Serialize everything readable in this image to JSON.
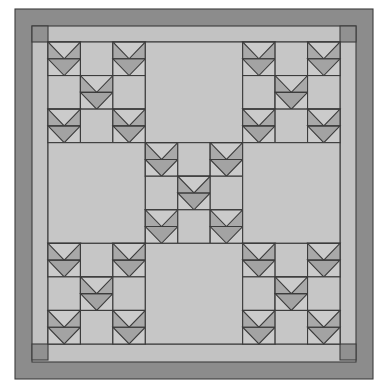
{
  "quilt": {
    "title": "Flying Geese Nine-Patch Quilt",
    "colors": {
      "background": "#ffffff",
      "outer_border": "#8c8c8c",
      "inner_frame": "#c2c2c2",
      "corner_square": "#919191",
      "field": "#c6c6c6",
      "goose_side": "#a9a9a9",
      "goose_center": "#a3a3a3",
      "sky": "#cbcbcb",
      "seam": "#3c3c3c"
    },
    "geometry": {
      "outer": {
        "x": 15,
        "y": 9,
        "w": 358,
        "h": 370
      },
      "inner": {
        "x": 32,
        "y": 26,
        "w": 324,
        "h": 336
      },
      "grid": {
        "x": 48,
        "y": 42,
        "w": 292,
        "h": 302
      }
    },
    "layout": {
      "blocks_per_side": 3,
      "cells_per_block": 3,
      "pieced_blocks": [
        [
          0,
          0
        ],
        [
          0,
          2
        ],
        [
          1,
          1
        ],
        [
          2,
          0
        ],
        [
          2,
          2
        ]
      ],
      "pieced_cells": [
        [
          0,
          0
        ],
        [
          0,
          2
        ],
        [
          1,
          1
        ],
        [
          2,
          0
        ],
        [
          2,
          2
        ]
      ]
    }
  }
}
